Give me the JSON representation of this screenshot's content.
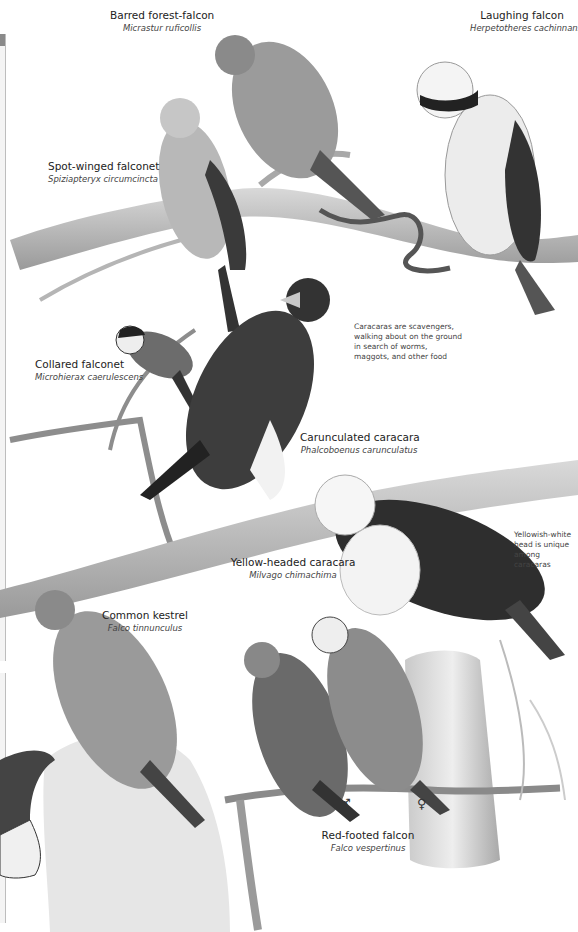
{
  "page": {
    "species": [
      {
        "id": "barred-forest-falcon",
        "common": "Barred forest-falcon",
        "scientific": "Micrastur ruficollis"
      },
      {
        "id": "laughing-falcon",
        "common": "Laughing falcon",
        "scientific": "Herpetotheres cachinnans"
      },
      {
        "id": "spot-winged-falconet",
        "common": "Spot-winged falconet",
        "scientific": "Spiziapteryx circumcincta"
      },
      {
        "id": "collared-falconet",
        "common": "Collared falconet",
        "scientific": "Microhierax caerulescens"
      },
      {
        "id": "carunculated-caracara",
        "common": "Carunculated caracara",
        "scientific": "Phalcoboenus carunculatus"
      },
      {
        "id": "yellow-headed-caracara",
        "common": "Yellow-headed caracara",
        "scientific": "Milvago chimachima"
      },
      {
        "id": "common-kestrel",
        "common": "Common kestrel",
        "scientific": "Falco tinnunculus"
      },
      {
        "id": "red-footed-falcon",
        "common": "Red-footed falcon",
        "scientific": "Falco vespertinus"
      }
    ],
    "notes": {
      "caracara_note": "Caracaras are scavengers, walking about on the ground in search of worms, maggots, and other food",
      "yellowhead_note": "Yellowish-white head is unique among caracaras"
    },
    "symbols": {
      "male": "♂",
      "female": "♀"
    }
  }
}
